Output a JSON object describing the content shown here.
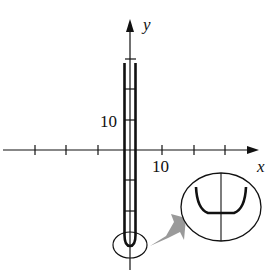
{
  "figure": {
    "type": "function-graph",
    "axes": {
      "x_label": "x",
      "y_label": "y",
      "x_tick_label": "10",
      "y_tick_label": "10",
      "x_tick_spacing_units": 5,
      "y_tick_spacing_units": 5
    },
    "curve": {
      "description": "narrow U-shaped curve, nearly vertical walls near x = 0, bottom below x-axis",
      "color": "#111111"
    },
    "inset": {
      "description": "magnified view of curve bottom showing flat U-shape",
      "pointer_color": "#999999"
    }
  },
  "colors": {
    "ink": "#111111",
    "background": "#ffffff",
    "arrow_fill": "#9a9a9a"
  }
}
